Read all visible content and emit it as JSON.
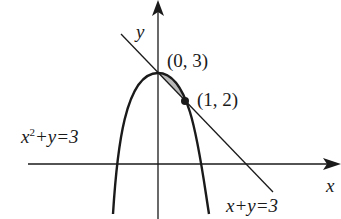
{
  "diagram": {
    "axes": {
      "x_label": "x",
      "y_label": "y"
    },
    "curves": [
      {
        "id": "parabola",
        "equation": "x^2 + y = 3",
        "label_base": "x",
        "label_exp": "2",
        "label_rest": "+y=3"
      },
      {
        "id": "line",
        "equation": "x + y = 3",
        "label": "x+y=3"
      }
    ],
    "points": [
      {
        "label": "(0, 3)",
        "x": 0,
        "y": 3
      },
      {
        "label": "(1, 2)",
        "x": 1,
        "y": 2
      }
    ],
    "shaded_region": "area between x^2+y=3 and x+y=3 from x=0 to x=1",
    "colors": {
      "stroke": "#1a1a1a",
      "shade": "#b8b8b8",
      "background": "#ffffff"
    }
  }
}
